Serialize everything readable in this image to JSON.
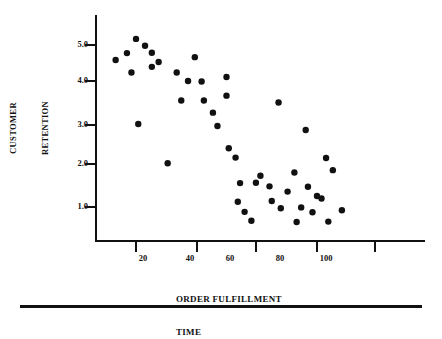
{
  "figure": {
    "background": "#ffffff",
    "ink_color": "#111111",
    "marker_color": "#111111"
  },
  "axes": {
    "y_axis": {
      "title_line1": "CUSTOMER",
      "title_line2": "RETENTION",
      "tick_labels": [
        "1.0",
        "2.0",
        "3.0",
        "4.0",
        "5.0"
      ],
      "tick_values": [
        1.0,
        2.0,
        3.0,
        4.0,
        5.0
      ]
    },
    "x_axis": {
      "title_line1": "ORDER FULFILLMENT",
      "title_line2": "TIME",
      "tick_labels": [
        "20",
        "40",
        "60",
        "80",
        "100"
      ],
      "tick_values": [
        20,
        40,
        60,
        80,
        100
      ]
    }
  },
  "chart_data": {
    "type": "scatter",
    "title": "",
    "subtitle": "",
    "xlabel": "ORDER FULFILLMENT TIME",
    "ylabel": "CUSTOMER RETENTION",
    "xlim": [
      5,
      118
    ],
    "ylim": [
      0.3,
      5.4
    ],
    "xticks": [
      20,
      40,
      60,
      80,
      100
    ],
    "yticks": [
      1.0,
      2.0,
      3.0,
      4.0,
      5.0
    ],
    "grid": false,
    "legend": null,
    "annotations": [],
    "series": [
      {
        "name": "observations",
        "marker": "filled-circle",
        "color": "#111111",
        "points": [
          [
            11,
            4.63
          ],
          [
            16,
            4.8
          ],
          [
            18,
            4.32
          ],
          [
            20,
            5.15
          ],
          [
            21,
            3.05
          ],
          [
            24,
            4.98
          ],
          [
            27,
            4.81
          ],
          [
            27,
            4.46
          ],
          [
            30,
            4.58
          ],
          [
            34,
            2.08
          ],
          [
            38,
            4.32
          ],
          [
            40,
            3.63
          ],
          [
            43,
            4.11
          ],
          [
            46,
            4.7
          ],
          [
            49,
            4.1
          ],
          [
            50,
            3.63
          ],
          [
            54,
            3.33
          ],
          [
            56,
            3.0
          ],
          [
            60,
            4.21
          ],
          [
            60,
            3.75
          ],
          [
            61,
            2.45
          ],
          [
            64,
            2.22
          ],
          [
            65,
            1.13
          ],
          [
            66,
            1.59
          ],
          [
            68,
            0.88
          ],
          [
            71,
            0.66
          ],
          [
            73,
            1.6
          ],
          [
            75,
            1.77
          ],
          [
            79,
            1.51
          ],
          [
            80,
            1.15
          ],
          [
            83,
            3.58
          ],
          [
            84,
            0.97
          ],
          [
            87,
            1.38
          ],
          [
            90,
            1.85
          ],
          [
            91,
            0.63
          ],
          [
            93,
            0.99
          ],
          [
            95,
            2.9
          ],
          [
            96,
            1.5
          ],
          [
            98,
            0.87
          ],
          [
            100,
            1.27
          ],
          [
            102,
            1.21
          ],
          [
            104,
            2.21
          ],
          [
            105,
            0.64
          ],
          [
            107,
            1.91
          ],
          [
            111,
            0.92
          ]
        ]
      }
    ]
  }
}
